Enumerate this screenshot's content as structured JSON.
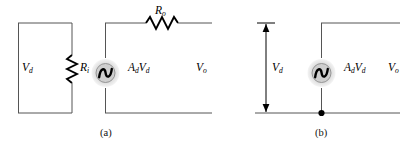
{
  "figure": {
    "type": "circuit-diagram",
    "background_color": "#ffffff",
    "wire_color": "#555555",
    "component_color": "#000000",
    "source_halo_color": "#d8d8d8"
  },
  "circuit_a": {
    "caption": "(a)",
    "labels": {
      "input_voltage": "V",
      "input_voltage_sub": "d",
      "input_resistor": "R",
      "input_resistor_sub": "i",
      "output_resistor": "R",
      "output_resistor_sub": "o",
      "source": "A",
      "source_sub1": "d",
      "source_mid": "V",
      "source_sub2": "d",
      "output_voltage": "V",
      "output_voltage_sub": "o"
    },
    "components": [
      {
        "name": "input-resistor",
        "symbol": "R_i",
        "orientation": "vertical"
      },
      {
        "name": "output-resistor",
        "symbol": "R_o",
        "orientation": "horizontal"
      },
      {
        "name": "dependent-source",
        "symbol": "A_d V_d",
        "shape": "circle-sine"
      }
    ]
  },
  "circuit_b": {
    "caption": "(b)",
    "labels": {
      "input_voltage": "V",
      "input_voltage_sub": "d",
      "source": "A",
      "source_sub1": "d",
      "source_mid": "V",
      "source_sub2": "d",
      "output_voltage": "V",
      "output_voltage_sub": "o"
    },
    "components": [
      {
        "name": "dependent-source",
        "symbol": "A_d V_d",
        "shape": "circle-sine"
      },
      {
        "name": "voltage-arrow",
        "symbol": "V_d",
        "shape": "double-headed-arrow"
      },
      {
        "name": "junction-dot",
        "shape": "filled-circle"
      }
    ]
  }
}
